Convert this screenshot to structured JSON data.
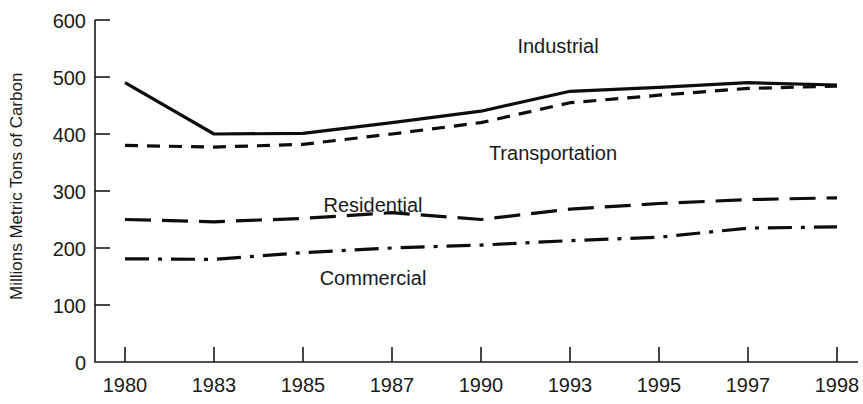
{
  "chart_data": {
    "type": "line",
    "title": "",
    "subtitle": "",
    "xlabel": "",
    "ylabel": "Millions Metric Tons of Carbon",
    "categories": [
      "1980",
      "1983",
      "1985",
      "1987",
      "1990",
      "1993",
      "1995",
      "1997",
      "1998"
    ],
    "x": [
      1980,
      1983,
      1985,
      1987,
      1990,
      1993,
      1995,
      1997,
      1998
    ],
    "ylim": [
      0,
      600
    ],
    "xlim": [
      1980,
      1998
    ],
    "y_ticks": [
      0,
      100,
      200,
      300,
      400,
      500,
      600
    ],
    "grid": false,
    "legend": "inline-labels",
    "series": [
      {
        "name": "Industrial",
        "style": "solid",
        "color": "#0d0d0d",
        "label_position": "above-line",
        "values": [
          490,
          400,
          401,
          420,
          440,
          475,
          482,
          490,
          486
        ]
      },
      {
        "name": "Transportation",
        "style": "dashed",
        "color": "#0d0d0d",
        "label_position": "below-line",
        "values": [
          380,
          377,
          382,
          400,
          420,
          455,
          468,
          480,
          484
        ]
      },
      {
        "name": "Residential",
        "style": "long-dash",
        "color": "#0d0d0d",
        "label_position": "above-line",
        "values": [
          250,
          246,
          252,
          262,
          250,
          268,
          278,
          285,
          288
        ]
      },
      {
        "name": "Commercial",
        "style": "dash-dot",
        "color": "#0d0d0d",
        "label_position": "below-line",
        "values": [
          181,
          180,
          192,
          200,
          205,
          213,
          219,
          235,
          237
        ]
      }
    ],
    "annotations": [
      {
        "text": "Industrial",
        "x": 1990,
        "y": 520
      },
      {
        "text": "Transportation",
        "x": 1990,
        "y": 357
      },
      {
        "text": "Residential",
        "x": 1986,
        "y": 295
      },
      {
        "text": "Commercial",
        "x": 1986,
        "y": 150
      }
    ]
  },
  "axis": {
    "y_tick_labels": [
      "600",
      "500",
      "400",
      "300",
      "200",
      "100",
      "0"
    ],
    "x_tick_labels": [
      "1980",
      "1983",
      "1985",
      "1987",
      "1990",
      "1993",
      "1995",
      "1997",
      "1998"
    ],
    "y_axis_title": "Millions Metric Tons of Carbon"
  },
  "series_labels": {
    "industrial": "Industrial",
    "transportation": "Transportation",
    "residential": "Residential",
    "commercial": "Commercial"
  }
}
